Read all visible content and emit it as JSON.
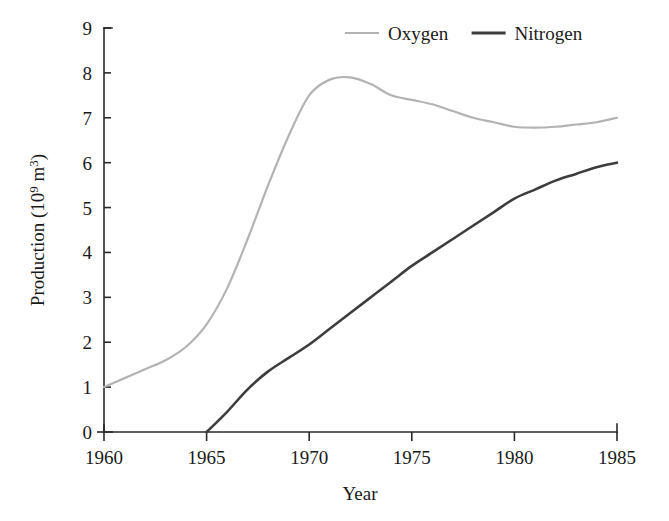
{
  "chart_data": {
    "type": "line",
    "title": "",
    "xlabel": "Year",
    "ylabel": "Production (10⁹ m³)",
    "ylabel_parts": {
      "main": "Production (10",
      "exponent": "9",
      "units": " m",
      "units_exponent": "3",
      "close": ")"
    },
    "xlim": [
      1960,
      1985
    ],
    "ylim": [
      0,
      9
    ],
    "grid": false,
    "legend_position": "top-center",
    "x_ticks": [
      1960,
      1965,
      1970,
      1975,
      1980,
      1985
    ],
    "x_tick_labels": [
      "1960",
      "1965",
      "1970",
      "1975",
      "1980",
      "1985"
    ],
    "y_ticks": [
      0,
      1,
      2,
      3,
      4,
      5,
      6,
      7,
      8,
      9
    ],
    "y_tick_labels": [
      "0",
      "1",
      "2",
      "3",
      "4",
      "5",
      "6",
      "7",
      "8",
      "9"
    ],
    "series": [
      {
        "name": "Oxygen",
        "color": "#b3b3b3",
        "stroke_width": 2.2,
        "x": [
          1960,
          1961,
          1962,
          1963,
          1964,
          1965,
          1966,
          1967,
          1968,
          1969,
          1970,
          1971,
          1972,
          1973,
          1974,
          1975,
          1976,
          1977,
          1978,
          1979,
          1980,
          1981,
          1982,
          1983,
          1984,
          1985
        ],
        "values": [
          1.0,
          1.2,
          1.4,
          1.6,
          1.9,
          2.4,
          3.2,
          4.3,
          5.5,
          6.6,
          7.5,
          7.85,
          7.9,
          7.75,
          7.5,
          7.4,
          7.3,
          7.15,
          7.0,
          6.9,
          6.8,
          6.78,
          6.8,
          6.85,
          6.9,
          7.0
        ]
      },
      {
        "name": "Nitrogen",
        "color": "#3d3d3d",
        "stroke_width": 2.6,
        "x": [
          1965,
          1966,
          1967,
          1968,
          1969,
          1970,
          1971,
          1972,
          1973,
          1974,
          1975,
          1976,
          1977,
          1978,
          1979,
          1980,
          1981,
          1982,
          1983,
          1984,
          1985
        ],
        "values": [
          0.0,
          0.45,
          0.95,
          1.35,
          1.65,
          1.95,
          2.3,
          2.65,
          3.0,
          3.35,
          3.7,
          4.0,
          4.3,
          4.6,
          4.9,
          5.2,
          5.4,
          5.6,
          5.75,
          5.9,
          6.0
        ]
      }
    ]
  },
  "legend": {
    "items": [
      {
        "label": "Oxygen",
        "color": "#b3b3b3"
      },
      {
        "label": "Nitrogen",
        "color": "#3d3d3d"
      }
    ]
  }
}
